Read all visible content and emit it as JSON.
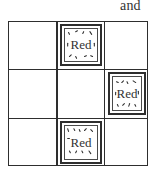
{
  "caption": "and",
  "grid": {
    "rows": 3,
    "cols": 3,
    "line_color": "#2e2e2e",
    "cells": [
      [
        null,
        {
          "label": "Red",
          "texture": "dashed-speckle"
        },
        null
      ],
      [
        null,
        null,
        {
          "label": "Red",
          "texture": "dashed-speckle"
        }
      ],
      [
        null,
        {
          "label": "Red",
          "texture": "dashed-speckle"
        },
        null
      ]
    ]
  },
  "tiles": [
    {
      "row": 1,
      "col": 2,
      "label": "Red"
    },
    {
      "row": 2,
      "col": 3,
      "label": "Red"
    },
    {
      "row": 3,
      "col": 2,
      "label": "Red"
    }
  ]
}
